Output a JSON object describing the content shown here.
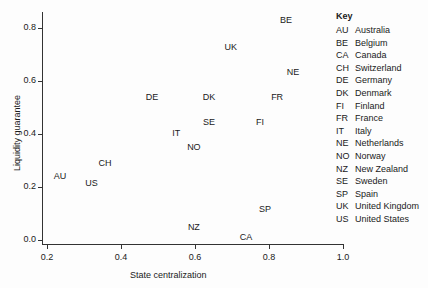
{
  "chart_data": {
    "type": "scatter",
    "title": "",
    "xlabel": "State centralization",
    "ylabel": "Liquidity guarantee",
    "xlim": [
      0.18,
      1.0
    ],
    "ylim": [
      -0.01,
      0.86
    ],
    "x_ticks": [
      "0.2",
      "0.4",
      "0.6",
      "0.8",
      "1.0"
    ],
    "y_ticks": [
      "0.0",
      "0.2",
      "0.4",
      "0.6",
      "0.8"
    ],
    "grid": false,
    "legend_position": "right",
    "marker": "text-label",
    "points": [
      {
        "label": "AU",
        "x": 0.235,
        "y": 0.24
      },
      {
        "label": "BE",
        "x": 0.846,
        "y": 0.83
      },
      {
        "label": "CA",
        "x": 0.738,
        "y": 0.01
      },
      {
        "label": "CH",
        "x": 0.357,
        "y": 0.29
      },
      {
        "label": "DE",
        "x": 0.484,
        "y": 0.54
      },
      {
        "label": "DK",
        "x": 0.638,
        "y": 0.54
      },
      {
        "label": "FI",
        "x": 0.776,
        "y": 0.445
      },
      {
        "label": "FR",
        "x": 0.822,
        "y": 0.54
      },
      {
        "label": "IT",
        "x": 0.549,
        "y": 0.404
      },
      {
        "label": "NE",
        "x": 0.865,
        "y": 0.634
      },
      {
        "label": "NO",
        "x": 0.597,
        "y": 0.351
      },
      {
        "label": "NZ",
        "x": 0.597,
        "y": 0.049
      },
      {
        "label": "SE",
        "x": 0.638,
        "y": 0.445
      },
      {
        "label": "SP",
        "x": 0.789,
        "y": 0.117
      },
      {
        "label": "UK",
        "x": 0.697,
        "y": 0.73
      },
      {
        "label": "US",
        "x": 0.32,
        "y": 0.215
      }
    ]
  },
  "legend": {
    "title": "Key",
    "items": [
      {
        "code": "AU",
        "name": "Australia"
      },
      {
        "code": "BE",
        "name": "Belgium"
      },
      {
        "code": "CA",
        "name": "Canada"
      },
      {
        "code": "CH",
        "name": "Switzerland"
      },
      {
        "code": "DE",
        "name": "Germany"
      },
      {
        "code": "DK",
        "name": "Denmark"
      },
      {
        "code": "FI",
        "name": "Finland"
      },
      {
        "code": "FR",
        "name": "France"
      },
      {
        "code": "IT",
        "name": "Italy"
      },
      {
        "code": "NE",
        "name": "Netherlands"
      },
      {
        "code": "NO",
        "name": "Norway"
      },
      {
        "code": "NZ",
        "name": "New Zealand"
      },
      {
        "code": "SE",
        "name": "Sweden"
      },
      {
        "code": "SP",
        "name": "Spain"
      },
      {
        "code": "UK",
        "name": "United Kingdom"
      },
      {
        "code": "US",
        "name": "United States"
      }
    ]
  }
}
